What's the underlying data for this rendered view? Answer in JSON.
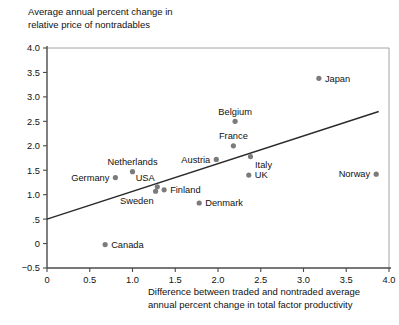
{
  "figure": {
    "ylabel_line1": "Average annual percent change in",
    "ylabel_line2": "relative price of nontradables",
    "xlabel_line1": "Difference between traded and nontraded average",
    "xlabel_line2": "annual percent change in total factor productivity"
  },
  "colors": {
    "point": "#7b7b7b",
    "axis": "#4a4a4a",
    "trend": "#2a2a2a",
    "text": "#111111",
    "background": "#ffffff"
  },
  "chart_data": {
    "type": "scatter",
    "title": "",
    "xlabel": "Difference between traded and nontraded average annual percent change in total factor productivity",
    "ylabel": "Average annual percent change in relative price of nontradables",
    "xlim": [
      0,
      4.0
    ],
    "ylim": [
      -0.5,
      4.0
    ],
    "xticks": [
      0,
      0.5,
      1.0,
      1.5,
      2.0,
      2.5,
      3.0,
      3.5,
      4.0
    ],
    "xtick_labels": [
      "0",
      "0.5",
      "1.0",
      "1.5",
      "2.0",
      "2.5",
      "3.0",
      "3.5",
      "4.0"
    ],
    "yticks": [
      -0.5,
      0,
      0.5,
      1.0,
      1.5,
      2.0,
      2.5,
      3.0,
      3.5,
      4.0
    ],
    "ytick_labels": [
      "−0.5",
      "0",
      ".5",
      "1.0",
      "1.5",
      "2.0",
      "2.5",
      "3.0",
      "3.5",
      "4.0"
    ],
    "grid": false,
    "legend": false,
    "points": [
      {
        "label": "Japan",
        "x": 3.18,
        "y": 3.38,
        "label_pos": "right"
      },
      {
        "label": "Belgium",
        "x": 2.2,
        "y": 2.5,
        "label_pos": "above"
      },
      {
        "label": "France",
        "x": 2.18,
        "y": 2.0,
        "label_pos": "above"
      },
      {
        "label": "Italy",
        "x": 2.38,
        "y": 1.78,
        "label_pos": "below-right"
      },
      {
        "label": "Austria",
        "x": 1.98,
        "y": 1.72,
        "label_pos": "left"
      },
      {
        "label": "UK",
        "x": 2.36,
        "y": 1.4,
        "label_pos": "right"
      },
      {
        "label": "Netherlands",
        "x": 1.0,
        "y": 1.47,
        "label_pos": "above"
      },
      {
        "label": "Germany",
        "x": 0.8,
        "y": 1.35,
        "label_pos": "left"
      },
      {
        "label": "Norway",
        "x": 3.85,
        "y": 1.42,
        "label_pos": "left"
      },
      {
        "label": "USA",
        "x": 1.29,
        "y": 1.16,
        "label_pos": "above-left"
      },
      {
        "label": "Finland",
        "x": 1.37,
        "y": 1.1,
        "label_pos": "right"
      },
      {
        "label": "Sweden",
        "x": 1.27,
        "y": 1.07,
        "label_pos": "below-left"
      },
      {
        "label": "Denmark",
        "x": 1.78,
        "y": 0.83,
        "label_pos": "right"
      },
      {
        "label": "Canada",
        "x": 0.68,
        "y": -0.02,
        "label_pos": "right"
      }
    ],
    "trendline": {
      "x0": 0.0,
      "y0": 0.5,
      "x1": 3.88,
      "y1": 2.7
    }
  }
}
